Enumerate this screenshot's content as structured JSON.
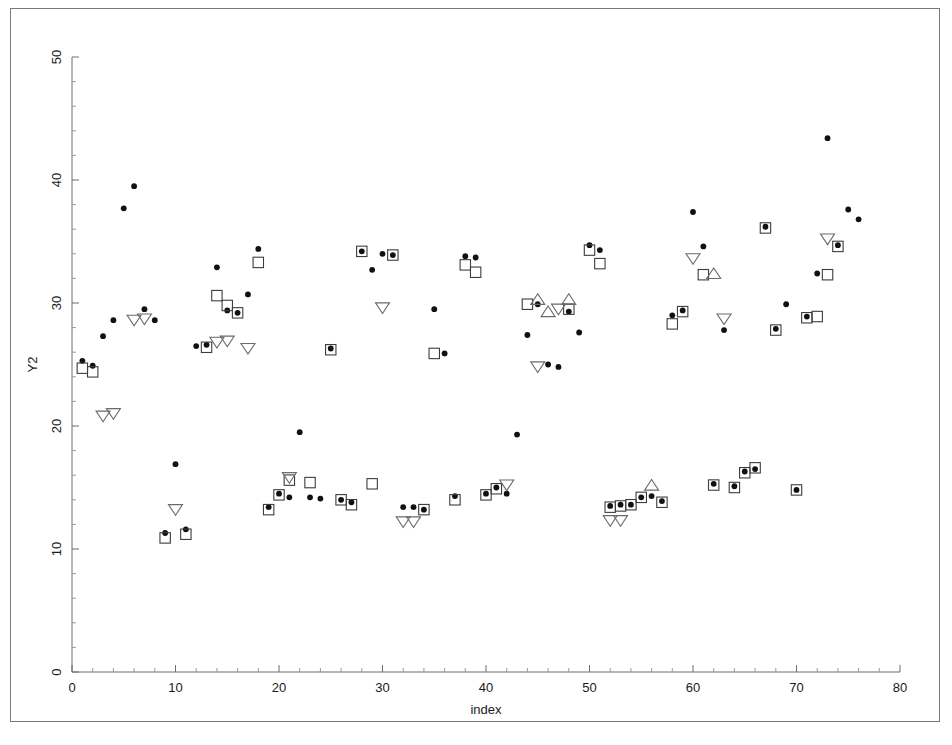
{
  "figure": {
    "background_color": "#ffffff",
    "frame_color": "#7a7a7a",
    "has_frame": true
  },
  "chart_data": {
    "type": "scatter",
    "title": "",
    "subtitle": "",
    "xlabel": "index",
    "ylabel": "Y2",
    "xlim": [
      0,
      80
    ],
    "ylim": [
      0,
      50
    ],
    "xticks": [
      0,
      10,
      20,
      30,
      40,
      50,
      60,
      70,
      80
    ],
    "xtick_labels": [
      "0",
      "10",
      "20",
      "30",
      "40",
      "50",
      "60",
      "70",
      "80"
    ],
    "yticks": [
      0,
      10,
      20,
      30,
      40,
      50
    ],
    "ytick_labels": [
      "0",
      "10",
      "20",
      "30",
      "40",
      "50"
    ],
    "x_minor_tick_step": 2,
    "y_minor_tick_step": 2,
    "grid": false,
    "legend": false,
    "legend_position": "none",
    "marker_colors": {
      "circle": "#111111",
      "square": "#3d3d3d",
      "triangle": "#6a6a6a"
    },
    "series": [
      {
        "name": "observed",
        "marker": "filled-circle",
        "marker_label": "circle-marker",
        "points": [
          {
            "x": 1,
            "y": 25.3
          },
          {
            "x": 2,
            "y": 24.9
          },
          {
            "x": 3,
            "y": 27.3
          },
          {
            "x": 4,
            "y": 28.6
          },
          {
            "x": 5,
            "y": 37.7
          },
          {
            "x": 6,
            "y": 39.5
          },
          {
            "x": 7,
            "y": 29.5
          },
          {
            "x": 8,
            "y": 28.6
          },
          {
            "x": 9,
            "y": 11.3
          },
          {
            "x": 10,
            "y": 16.9
          },
          {
            "x": 11,
            "y": 11.6
          },
          {
            "x": 12,
            "y": 26.5
          },
          {
            "x": 13,
            "y": 26.6
          },
          {
            "x": 14,
            "y": 32.9
          },
          {
            "x": 15,
            "y": 29.4
          },
          {
            "x": 16,
            "y": 29.2
          },
          {
            "x": 17,
            "y": 30.7
          },
          {
            "x": 18,
            "y": 34.4
          },
          {
            "x": 19,
            "y": 13.4
          },
          {
            "x": 20,
            "y": 14.5
          },
          {
            "x": 21,
            "y": 14.2
          },
          {
            "x": 22,
            "y": 19.5
          },
          {
            "x": 23,
            "y": 14.2
          },
          {
            "x": 24,
            "y": 14.1
          },
          {
            "x": 25,
            "y": 26.3
          },
          {
            "x": 26,
            "y": 14.0
          },
          {
            "x": 27,
            "y": 13.8
          },
          {
            "x": 28,
            "y": 34.2
          },
          {
            "x": 29,
            "y": 32.7
          },
          {
            "x": 30,
            "y": 34.0
          },
          {
            "x": 31,
            "y": 33.9
          },
          {
            "x": 32,
            "y": 13.4
          },
          {
            "x": 33,
            "y": 13.4
          },
          {
            "x": 34,
            "y": 13.2
          },
          {
            "x": 35,
            "y": 29.5
          },
          {
            "x": 36,
            "y": 25.9
          },
          {
            "x": 37,
            "y": 14.3
          },
          {
            "x": 38,
            "y": 33.8
          },
          {
            "x": 39,
            "y": 33.7
          },
          {
            "x": 40,
            "y": 14.5
          },
          {
            "x": 41,
            "y": 15.0
          },
          {
            "x": 42,
            "y": 14.5
          },
          {
            "x": 43,
            "y": 19.3
          },
          {
            "x": 44,
            "y": 27.4
          },
          {
            "x": 45,
            "y": 29.9
          },
          {
            "x": 46,
            "y": 25.0
          },
          {
            "x": 47,
            "y": 24.8
          },
          {
            "x": 48,
            "y": 29.3
          },
          {
            "x": 49,
            "y": 27.6
          },
          {
            "x": 50,
            "y": 34.7
          },
          {
            "x": 51,
            "y": 34.3
          },
          {
            "x": 52,
            "y": 13.5
          },
          {
            "x": 53,
            "y": 13.6
          },
          {
            "x": 54,
            "y": 13.6
          },
          {
            "x": 55,
            "y": 14.2
          },
          {
            "x": 56,
            "y": 14.3
          },
          {
            "x": 57,
            "y": 13.9
          },
          {
            "x": 58,
            "y": 29.0
          },
          {
            "x": 59,
            "y": 29.4
          },
          {
            "x": 60,
            "y": 37.4
          },
          {
            "x": 61,
            "y": 34.6
          },
          {
            "x": 62,
            "y": 15.3
          },
          {
            "x": 63,
            "y": 27.8
          },
          {
            "x": 64,
            "y": 15.1
          },
          {
            "x": 65,
            "y": 16.3
          },
          {
            "x": 66,
            "y": 16.5
          },
          {
            "x": 67,
            "y": 36.2
          },
          {
            "x": 68,
            "y": 27.9
          },
          {
            "x": 69,
            "y": 29.9
          },
          {
            "x": 70,
            "y": 14.8
          },
          {
            "x": 71,
            "y": 28.9
          },
          {
            "x": 72,
            "y": 32.4
          },
          {
            "x": 73,
            "y": 43.4
          },
          {
            "x": 74,
            "y": 34.7
          },
          {
            "x": 75,
            "y": 37.6
          },
          {
            "x": 76,
            "y": 36.8
          }
        ]
      },
      {
        "name": "predicted",
        "marker": "open-square",
        "marker_label": "square-marker",
        "points": [
          {
            "x": 1,
            "y": 24.7
          },
          {
            "x": 2,
            "y": 24.4
          },
          {
            "x": 9,
            "y": 10.9
          },
          {
            "x": 11,
            "y": 11.2
          },
          {
            "x": 13,
            "y": 26.4
          },
          {
            "x": 14,
            "y": 30.6
          },
          {
            "x": 15,
            "y": 29.8
          },
          {
            "x": 16,
            "y": 29.2
          },
          {
            "x": 18,
            "y": 33.3
          },
          {
            "x": 19,
            "y": 13.2
          },
          {
            "x": 20,
            "y": 14.4
          },
          {
            "x": 21,
            "y": 15.6
          },
          {
            "x": 23,
            "y": 15.4
          },
          {
            "x": 25,
            "y": 26.2
          },
          {
            "x": 26,
            "y": 14.0
          },
          {
            "x": 27,
            "y": 13.6
          },
          {
            "x": 28,
            "y": 34.2
          },
          {
            "x": 29,
            "y": 15.3
          },
          {
            "x": 31,
            "y": 33.9
          },
          {
            "x": 34,
            "y": 13.2
          },
          {
            "x": 35,
            "y": 25.9
          },
          {
            "x": 37,
            "y": 14.0
          },
          {
            "x": 38,
            "y": 33.1
          },
          {
            "x": 39,
            "y": 32.5
          },
          {
            "x": 40,
            "y": 14.4
          },
          {
            "x": 41,
            "y": 14.9
          },
          {
            "x": 44,
            "y": 29.9
          },
          {
            "x": 48,
            "y": 29.5
          },
          {
            "x": 50,
            "y": 34.3
          },
          {
            "x": 51,
            "y": 33.2
          },
          {
            "x": 52,
            "y": 13.4
          },
          {
            "x": 53,
            "y": 13.5
          },
          {
            "x": 54,
            "y": 13.6
          },
          {
            "x": 55,
            "y": 14.2
          },
          {
            "x": 57,
            "y": 13.8
          },
          {
            "x": 58,
            "y": 28.3
          },
          {
            "x": 59,
            "y": 29.3
          },
          {
            "x": 61,
            "y": 32.3
          },
          {
            "x": 62,
            "y": 15.2
          },
          {
            "x": 64,
            "y": 15.0
          },
          {
            "x": 65,
            "y": 16.2
          },
          {
            "x": 66,
            "y": 16.6
          },
          {
            "x": 67,
            "y": 36.1
          },
          {
            "x": 68,
            "y": 27.8
          },
          {
            "x": 70,
            "y": 14.8
          },
          {
            "x": 71,
            "y": 28.8
          },
          {
            "x": 72,
            "y": 28.9
          },
          {
            "x": 73,
            "y": 32.3
          },
          {
            "x": 74,
            "y": 34.6
          }
        ]
      },
      {
        "name": "interval-low",
        "marker": "open-triangle-down",
        "marker_label": "triangle-down-marker",
        "points": [
          {
            "x": 3,
            "y": 20.8
          },
          {
            "x": 4,
            "y": 21.0
          },
          {
            "x": 6,
            "y": 28.6
          },
          {
            "x": 7,
            "y": 28.7
          },
          {
            "x": 10,
            "y": 13.2
          },
          {
            "x": 14,
            "y": 26.8
          },
          {
            "x": 15,
            "y": 26.9
          },
          {
            "x": 17,
            "y": 26.3
          },
          {
            "x": 21,
            "y": 15.8
          },
          {
            "x": 30,
            "y": 29.6
          },
          {
            "x": 32,
            "y": 12.2
          },
          {
            "x": 33,
            "y": 12.2
          },
          {
            "x": 42,
            "y": 15.2
          },
          {
            "x": 45,
            "y": 24.8
          },
          {
            "x": 47,
            "y": 29.5
          },
          {
            "x": 52,
            "y": 12.3
          },
          {
            "x": 53,
            "y": 12.3
          },
          {
            "x": 60,
            "y": 33.6
          },
          {
            "x": 63,
            "y": 28.7
          },
          {
            "x": 73,
            "y": 35.2
          }
        ]
      },
      {
        "name": "interval-high",
        "marker": "open-triangle-up",
        "marker_label": "triangle-up-marker",
        "points": [
          {
            "x": 45,
            "y": 30.3
          },
          {
            "x": 46,
            "y": 29.3
          },
          {
            "x": 48,
            "y": 30.3
          },
          {
            "x": 62,
            "y": 32.4
          },
          {
            "x": 56,
            "y": 15.2
          }
        ]
      }
    ]
  },
  "axes": {
    "x_axis_name": "index",
    "y_axis_name": "Y2"
  }
}
